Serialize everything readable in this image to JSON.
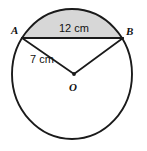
{
  "figure": {
    "type": "circle-with-chord-and-segment",
    "labels": {
      "point_a": "A",
      "point_b": "B",
      "center": "O",
      "chord_length": "12 cm",
      "radius_length": "7 cm"
    },
    "colors": {
      "stroke": "#1a1a1a",
      "segment_fill": "#d7d7d7",
      "background": "#ffffff"
    },
    "geometry": {
      "circle_center_x": 72,
      "circle_center_y": 74,
      "circle_radius_x": 60,
      "circle_radius_y": 65,
      "point_a_x": 22,
      "point_a_y": 38,
      "point_b_x": 123,
      "point_b_y": 38,
      "center_point_x": 74,
      "center_point_y": 74,
      "stroke_width": 1.8
    }
  }
}
